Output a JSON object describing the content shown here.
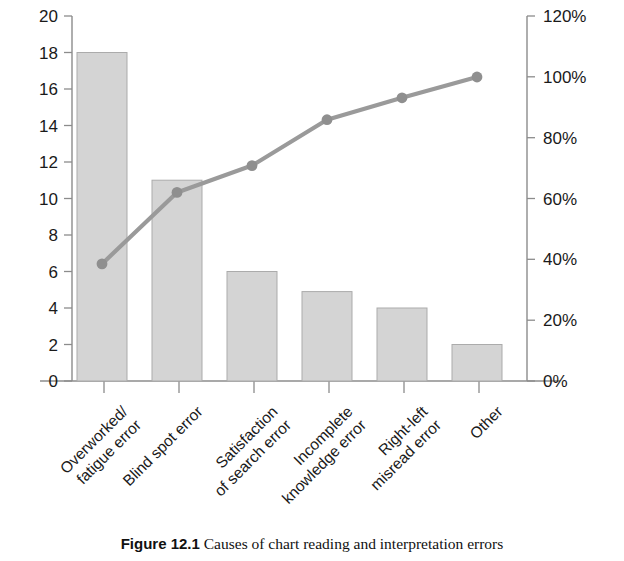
{
  "chart_data": {
    "type": "bar",
    "title": "",
    "subtitle": "",
    "xlabel": "",
    "ylabel": "",
    "categories": [
      "Overworked/\nfatigue error",
      "Blind spot error",
      "Satisfaction\nof search error",
      "Incomplete\nknowledge error",
      "Right-left\nmisread error",
      "Other"
    ],
    "series": [
      {
        "name": "Count",
        "type": "bar",
        "axis": "left",
        "values": [
          18,
          11,
          6,
          4.9,
          4,
          2
        ]
      },
      {
        "name": "Cumulative percentage",
        "type": "line",
        "axis": "right",
        "values": [
          38.5,
          62.0,
          70.8,
          85.9,
          93.1,
          100.0
        ]
      }
    ],
    "left_axis": {
      "min": 0,
      "max": 20,
      "step": 2,
      "ticks": [
        "0",
        "2",
        "4",
        "6",
        "8",
        "10",
        "12",
        "14",
        "16",
        "18",
        "20"
      ]
    },
    "right_axis": {
      "min": 0,
      "max": 120,
      "step": 20,
      "suffix": "%",
      "ticks": [
        "0%",
        "20%",
        "40%",
        "60%",
        "80%",
        "100%",
        "120%"
      ]
    },
    "grid": false,
    "legend": "none",
    "colors": {
      "bar_fill": "#d4d4d4",
      "bar_stroke": "#a8a8a8",
      "line": "#9a9a9a",
      "marker": "#8f8f8f",
      "axis": "#8c8c8c",
      "text": "#1a1a1a"
    }
  },
  "caption": {
    "number": "Figure 12.1",
    "text": "Causes of chart reading and interpretation errors"
  }
}
